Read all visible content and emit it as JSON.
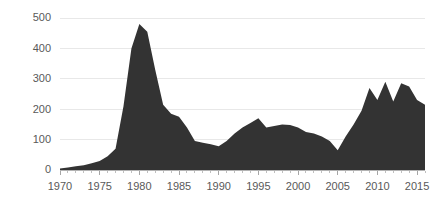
{
  "chart_data": {
    "type": "area",
    "title": "",
    "subtitle": "",
    "xlabel": "",
    "ylabel": "",
    "grid": true,
    "legend_position": "none",
    "series_color": "#333333",
    "xlim": [
      1970,
      2016
    ],
    "ylim": [
      0,
      500
    ],
    "x_tick_labels": [
      "1970",
      "1975",
      "1980",
      "1985",
      "1990",
      "1995",
      "2000",
      "2005",
      "2010",
      "2015"
    ],
    "x_tick_values": [
      1970,
      1975,
      1980,
      1985,
      1990,
      1995,
      2000,
      2005,
      2010,
      2015
    ],
    "x_minor_ticks": true,
    "y_tick_labels": [
      "0",
      "100",
      "200",
      "300",
      "400",
      "500"
    ],
    "y_tick_values": [
      0,
      100,
      200,
      300,
      400,
      500
    ],
    "series": [
      {
        "name": "series-1",
        "x": [
          1970,
          1971,
          1972,
          1973,
          1974,
          1975,
          1976,
          1977,
          1978,
          1979,
          1980,
          1981,
          1982,
          1983,
          1984,
          1985,
          1986,
          1987,
          1988,
          1989,
          1990,
          1991,
          1992,
          1993,
          1994,
          1995,
          1996,
          1997,
          1998,
          1999,
          2000,
          2001,
          2002,
          2003,
          2004,
          2005,
          2006,
          2007,
          2008,
          2009,
          2010,
          2011,
          2012,
          2013,
          2014,
          2015,
          2016
        ],
        "values": [
          5,
          8,
          12,
          16,
          22,
          30,
          45,
          70,
          210,
          400,
          480,
          455,
          330,
          215,
          185,
          175,
          140,
          95,
          90,
          85,
          78,
          95,
          120,
          140,
          155,
          170,
          140,
          145,
          150,
          148,
          140,
          125,
          120,
          110,
          95,
          65,
          110,
          150,
          195,
          270,
          230,
          290,
          225,
          285,
          275,
          230,
          215
        ]
      }
    ],
    "annotations": []
  }
}
